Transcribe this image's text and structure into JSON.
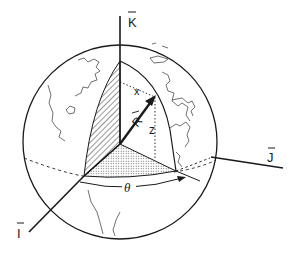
{
  "diagram": {
    "axes": {
      "k_label": "K",
      "i_label": "I",
      "j_label": "J"
    },
    "vector_label": "R",
    "component_labels": {
      "x": "x",
      "z": "z"
    },
    "angle_label": "θ",
    "colors": {
      "ink": "#1a1a1a",
      "background": "#ffffff",
      "stipple": "#9a9a9a"
    }
  }
}
